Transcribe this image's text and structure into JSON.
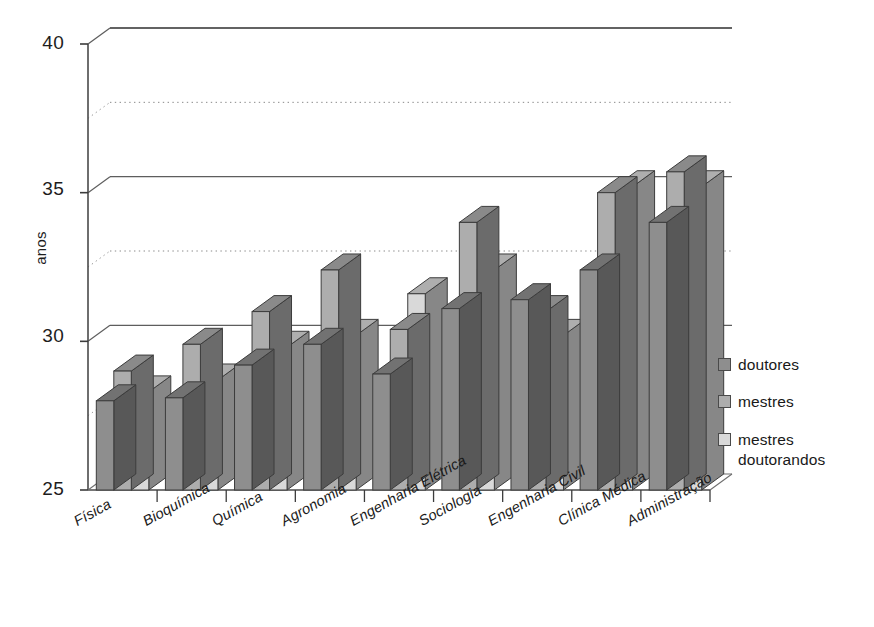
{
  "chart_data": {
    "type": "bar",
    "title": "",
    "subtitle": "",
    "xlabel": "",
    "ylabel": "anos",
    "ylim": [
      25,
      40
    ],
    "yticks": [
      25,
      30,
      35,
      40
    ],
    "minor_gridlines": [
      27.5,
      32.5,
      37.5
    ],
    "grid": true,
    "three_d": true,
    "legend_position": "right",
    "categories": [
      "Física",
      "Bioquímica",
      "Química",
      "Agronomia",
      "Engenharia Elétrica",
      "Sociologia",
      "Engenharia Civil",
      "Clínica Médica",
      "Administração"
    ],
    "series": [
      {
        "name": "doutores",
        "color": "#8e8e8e",
        "values": [
          28.0,
          28.1,
          29.2,
          29.9,
          28.9,
          31.1,
          31.4,
          32.4,
          34.0
        ]
      },
      {
        "name": "mestres",
        "color": "#adadad",
        "values": [
          29.0,
          29.9,
          31.0,
          32.4,
          30.4,
          34.0,
          31.0,
          35.0,
          35.7
        ]
      },
      {
        "name": "mestres doutorandos",
        "color": "#d9d9d9",
        "values": [
          28.3,
          28.7,
          29.8,
          30.2,
          31.6,
          32.4,
          30.2,
          35.2,
          35.2
        ]
      }
    ]
  },
  "legend": {
    "items": [
      {
        "label": "doutores"
      },
      {
        "label": "mestres"
      },
      {
        "label": "mestres doutorandos"
      }
    ]
  },
  "axis": {
    "y_label": "anos",
    "y_tick_labels": [
      "40",
      "35",
      "30",
      "25"
    ]
  },
  "colors": {
    "series_dark": "#8e8e8e",
    "series_mid": "#adadad",
    "series_light": "#d9d9d9",
    "outline": "#3c3c3c",
    "grid": "#6b6b6b",
    "background": "#ffffff"
  }
}
